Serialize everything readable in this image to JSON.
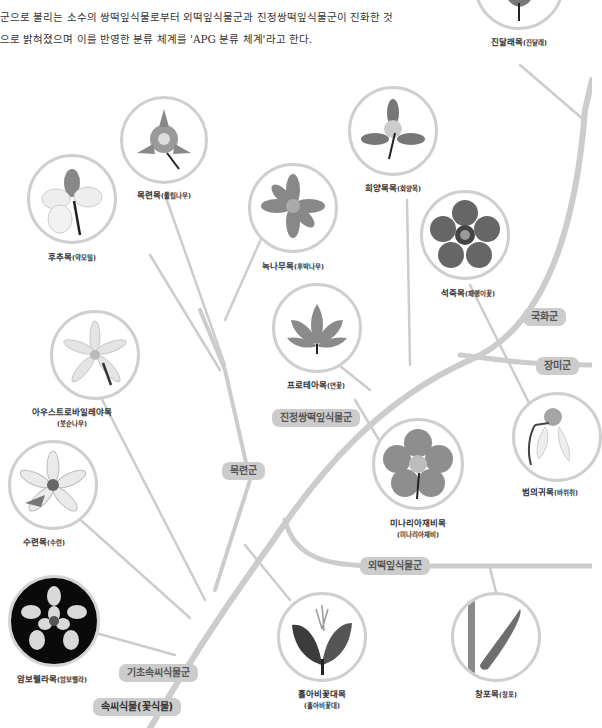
{
  "intro": {
    "line1": "군으로 불리는 소수의 쌍떡잎식물로부터 외떡잎식물군과 진정쌍떡잎식물군이 진화한 것",
    "line2": "으로 밝혀졌으며 이를 반영한 분류 체계를 'APG 분류 체계'라고 한다."
  },
  "colors": {
    "branch": "#cccccc",
    "circle_border": "#cfcfcf",
    "pill_bg": "#cccccc",
    "pill_text": "#555555"
  },
  "groups": {
    "root": "속씨식물(꽃식물)",
    "basal": "기초속씨식물군",
    "magnoliids": "목련군",
    "eudicots": "진정쌍떡잎식물군",
    "monocots": "외떡잎식물군",
    "asterids": "국화군",
    "rosids": "장미군"
  },
  "orders": [
    {
      "id": "ericales",
      "name": "진달래목",
      "example": "(진달래)",
      "icon": "rhododendron-leaf-icon"
    },
    {
      "id": "magnoliales",
      "name": "목련목",
      "example": "(튤립나무)",
      "icon": "tulip-tree-flower-icon"
    },
    {
      "id": "piperales",
      "name": "후추목",
      "example": "(약모밀)",
      "icon": "houttuynia-flower-icon"
    },
    {
      "id": "cornales",
      "name": "회양목목",
      "example": "(회양목)",
      "icon": "boxwood-flower-icon"
    },
    {
      "id": "laurales",
      "name": "녹나무목",
      "example": "(후박나무)",
      "icon": "machilus-flower-icon"
    },
    {
      "id": "caryophyllales",
      "name": "석죽목",
      "example": "(패랭이꽃)",
      "icon": "dianthus-flower-icon"
    },
    {
      "id": "proteales",
      "name": "프로테아목",
      "example": "(연꽃)",
      "icon": "lotus-flower-icon"
    },
    {
      "id": "austrobaileyales",
      "name": "아우스트로바일레야목",
      "example": "(붓순나무)",
      "icon": "illicium-flower-icon"
    },
    {
      "id": "saxifragales",
      "name": "범의귀목",
      "example": "(바위취)",
      "icon": "saxifrage-flower-icon"
    },
    {
      "id": "ranunculales",
      "name": "미나리아재비목",
      "example": "(미나리아재비)",
      "icon": "buttercup-flower-icon"
    },
    {
      "id": "nymphaeales",
      "name": "수련목",
      "example": "(수련)",
      "icon": "water-lily-flower-icon"
    },
    {
      "id": "amborellales",
      "name": "암보렐라목",
      "example": "(암보렐라)",
      "icon": "amborella-flower-icon"
    },
    {
      "id": "chloranthales",
      "name": "홀아비꽃대목",
      "example": "(홀아비꽃대)",
      "icon": "chloranthus-flower-icon"
    },
    {
      "id": "acorales",
      "name": "창포목",
      "example": "(창포)",
      "icon": "acorus-spadix-icon"
    }
  ]
}
